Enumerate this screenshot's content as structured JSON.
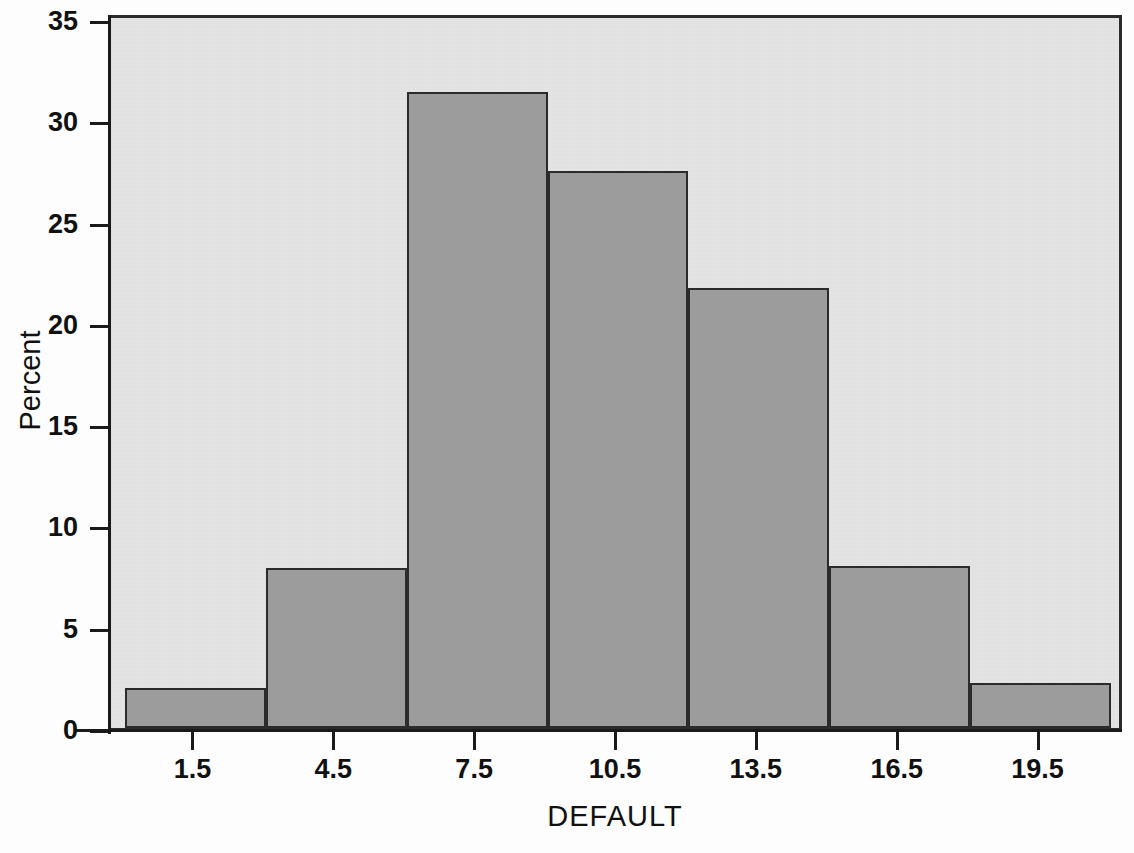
{
  "chart_data": {
    "type": "bar",
    "title": "",
    "xlabel": "DEFAULT",
    "ylabel": "Percent",
    "categories": [
      "1.5",
      "4.5",
      "7.5",
      "10.5",
      "13.5",
      "16.5",
      "19.5"
    ],
    "values": [
      2.0,
      7.9,
      31.4,
      27.5,
      21.7,
      8.0,
      2.2
    ],
    "bin_width": 3,
    "xlim": [
      0,
      21
    ],
    "ylim": [
      0,
      35
    ],
    "x_ticks": [
      "1.5",
      "4.5",
      "7.5",
      "10.5",
      "13.5",
      "16.5",
      "19.5"
    ],
    "y_ticks": [
      "0",
      "5",
      "10",
      "15",
      "20",
      "25",
      "30",
      "35"
    ],
    "grid": false,
    "legend": false,
    "bar_fill_color": "#9c9c9c",
    "bar_edge_color": "#2b2b2b",
    "plot_background_color": "#e4e4e4",
    "figure_background_color": "#fdfdfd"
  },
  "axes": {
    "y_title": "Percent",
    "x_title": "DEFAULT",
    "y_tick_labels": [
      "35",
      "30",
      "25",
      "20",
      "15",
      "10",
      "5",
      "0"
    ],
    "x_tick_labels": [
      "1.5",
      "4.5",
      "7.5",
      "10.5",
      "13.5",
      "16.5",
      "19.5"
    ]
  },
  "artifacts": {
    "bleed_text_1": "",
    "bleed_text_2": "",
    "bleed_text_3": ""
  }
}
